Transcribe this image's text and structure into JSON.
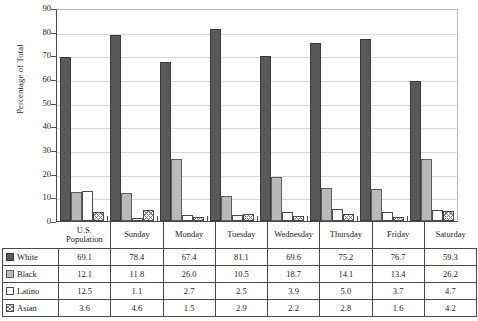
{
  "chart_data": {
    "type": "bar",
    "title": "",
    "xlabel": "",
    "ylabel": "Percentage of Total",
    "ylim": [
      0,
      90
    ],
    "ytick_step": 10,
    "yticks": [
      90,
      80,
      70,
      60,
      50,
      40,
      30,
      20,
      10,
      0
    ],
    "grid": true,
    "legend_position": "table-below",
    "categories": [
      "U.S. Population",
      "Sunday",
      "Monday",
      "Tuesday",
      "Wednesday",
      "Thursday",
      "Friday",
      "Saturday"
    ],
    "category_lines": [
      [
        "U.S.",
        "Population"
      ],
      [
        "Sunday"
      ],
      [
        "Monday"
      ],
      [
        "Tuesday"
      ],
      [
        "Wednesday"
      ],
      [
        "Thursday"
      ],
      [
        "Friday"
      ],
      [
        "Saturday"
      ]
    ],
    "series": [
      {
        "name": "White",
        "swatch": "s-white",
        "color": "#595959",
        "values": [
          69.1,
          78.4,
          67.4,
          81.1,
          69.6,
          75.2,
          76.7,
          59.3
        ]
      },
      {
        "name": "Black",
        "swatch": "s-black",
        "color": "#b9b9b9",
        "values": [
          12.1,
          11.8,
          26.0,
          10.5,
          18.7,
          14.1,
          13.4,
          26.2
        ]
      },
      {
        "name": "Latino",
        "swatch": "s-latino",
        "color": "#ffffff",
        "values": [
          12.5,
          1.1,
          2.7,
          2.5,
          3.9,
          5.0,
          3.7,
          4.7
        ]
      },
      {
        "name": "Asian",
        "swatch": "s-asian",
        "color": "#ffffff",
        "values": [
          3.6,
          4.6,
          1.5,
          2.9,
          2.2,
          2.8,
          1.6,
          4.2
        ]
      }
    ]
  },
  "table": {
    "header_blank": "",
    "columns": [
      "U.S. Population",
      "Sunday",
      "Monday",
      "Tuesday",
      "Wednesday",
      "Thursday",
      "Friday",
      "Saturday"
    ],
    "rows": [
      {
        "label": "White",
        "values": [
          "69.1",
          "78.4",
          "67.4",
          "81.1",
          "69.6",
          "75.2",
          "76.7",
          "59.3"
        ]
      },
      {
        "label": "Black",
        "values": [
          "12.1",
          "11.8",
          "26.0",
          "10.5",
          "18.7",
          "14.1",
          "13.4",
          "26.2"
        ]
      },
      {
        "label": "Latino",
        "values": [
          "12.5",
          "1.1",
          "2.7",
          "2.5",
          "3.9",
          "5.0",
          "3.7",
          "4.7"
        ]
      },
      {
        "label": "Asian",
        "values": [
          "3.6",
          "4.6",
          "1.5",
          "2.9",
          "2.2",
          "2.8",
          "1.6",
          "4.2"
        ]
      }
    ]
  }
}
